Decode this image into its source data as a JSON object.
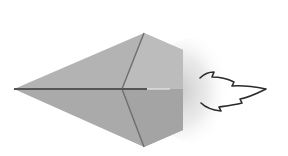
{
  "illustration": {
    "subject": "paper-airplane-with-exhaust-flame",
    "colors": {
      "background": "#ffffff",
      "paper_light": "#b5b5b5",
      "paper_mid": "#a9a9a9",
      "paper_dark": "#9c9c9c",
      "crease": "#5a5a5a",
      "exhaust": "#cfcfcf",
      "flame_outline": "#2b2b2b"
    }
  }
}
